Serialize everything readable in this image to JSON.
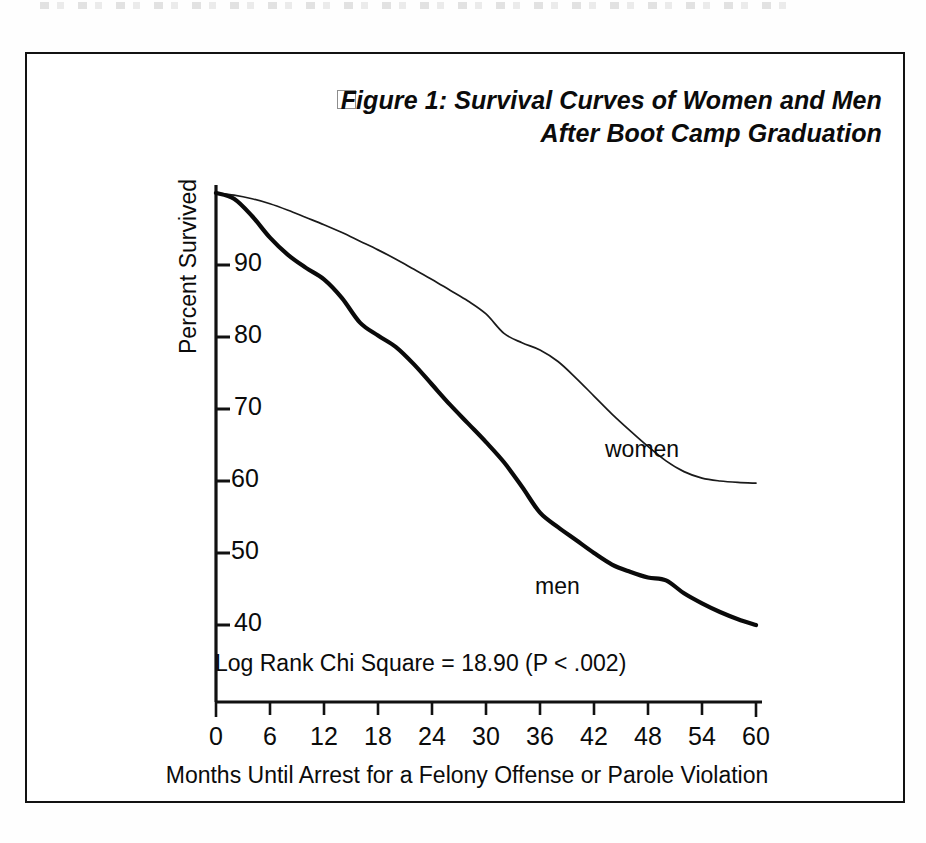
{
  "figure": {
    "bullet_icon": "empty-square-bullet",
    "title_lines": [
      "Figure 1: Survival Curves of Women and Men",
      "After Boot Camp Graduation"
    ],
    "statistic_note": "Log Rank Chi Square = 18.90 (P < .002)"
  },
  "chart_data": {
    "type": "line",
    "title": "Figure 1: Survival Curves of Women and Men After Boot Camp Graduation",
    "subtitle": "",
    "xlabel": "Months Until Arrest for a Felony Offense or Parole Violation",
    "ylabel": "Percent Survived",
    "xlim": [
      0,
      60
    ],
    "ylim": [
      36,
      100
    ],
    "xticks": [
      0,
      6,
      12,
      18,
      24,
      30,
      36,
      42,
      48,
      54,
      60
    ],
    "xtick_labels": [
      "0",
      "6",
      "12",
      "18",
      "24",
      "30",
      "36",
      "42",
      "48",
      "54",
      "60"
    ],
    "yticks": [
      40,
      50,
      60,
      70,
      80,
      90
    ],
    "ytick_labels": [
      "40",
      "50",
      "60",
      "70",
      "80",
      "90"
    ],
    "grid": false,
    "legend_position": "inline-annotation",
    "annotations": [
      {
        "text": "women",
        "x": 44,
        "y": 71
      },
      {
        "text": "men",
        "x": 34,
        "y": 52
      },
      {
        "text": "Log Rank Chi Square = 18.90 (P < .002)",
        "x": 0,
        "y": 37
      }
    ],
    "x": [
      0,
      2,
      4,
      6,
      8,
      10,
      12,
      14,
      16,
      18,
      20,
      22,
      24,
      26,
      28,
      30,
      32,
      34,
      36,
      38,
      40,
      42,
      44,
      46,
      48,
      50,
      52,
      54,
      56,
      58,
      60
    ],
    "series": [
      {
        "name": "women",
        "style": "thin",
        "values": [
          100,
          99.7,
          99.2,
          98.5,
          97.6,
          96.6,
          95.6,
          94.5,
          93.3,
          92.1,
          90.8,
          89.4,
          88.0,
          86.5,
          85.0,
          83.2,
          80.5,
          79.2,
          78.2,
          76.6,
          74.3,
          71.8,
          69.3,
          67.0,
          64.8,
          62.8,
          61.3,
          60.4,
          60.0,
          59.8,
          59.7
        ]
      },
      {
        "name": "men",
        "style": "thick",
        "values": [
          100,
          99.2,
          96.8,
          93.8,
          91.4,
          89.6,
          88.0,
          85.4,
          82.0,
          80.2,
          78.6,
          76.2,
          73.4,
          70.6,
          68.0,
          65.4,
          62.6,
          59.2,
          55.6,
          53.6,
          51.8,
          50.0,
          48.4,
          47.4,
          46.6,
          46.2,
          44.4,
          43.0,
          41.8,
          40.8,
          40.0
        ]
      }
    ]
  },
  "axis_geometry": {
    "x0_px": 189,
    "x60_px": 729,
    "y100_px": 139,
    "y40_px": 571,
    "axis_bottom_px": 648
  }
}
